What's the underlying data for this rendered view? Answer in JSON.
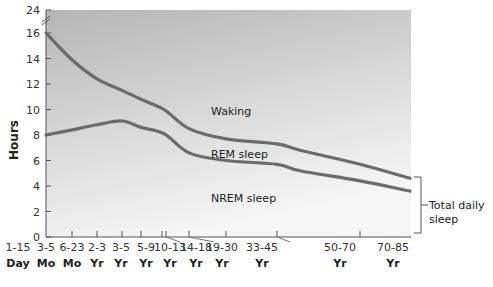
{
  "chart_data": {
    "type": "line",
    "title": "",
    "xlabel": "",
    "ylabel": "Hours",
    "ylim": [
      0,
      24
    ],
    "y_axis_break": true,
    "yticks": [
      0,
      2,
      4,
      6,
      8,
      10,
      12,
      14,
      16,
      24
    ],
    "grid": false,
    "categories": [
      {
        "range": "1-15",
        "unit": "Day"
      },
      {
        "range": "3-5",
        "unit": "Mo"
      },
      {
        "range": "6-23",
        "unit": "Mo"
      },
      {
        "range": "2-3",
        "unit": "Yr"
      },
      {
        "range": "3-5",
        "unit": "Yr"
      },
      {
        "range": "5-9",
        "unit": "Yr"
      },
      {
        "range": "10-13",
        "unit": "Yr"
      },
      {
        "range": "14-18",
        "unit": "Yr"
      },
      {
        "range": "19-30",
        "unit": "Yr"
      },
      {
        "range": "33-45",
        "unit": "Yr"
      },
      {
        "range": "50-70",
        "unit": "Yr"
      },
      {
        "range": "70-85",
        "unit": "Yr"
      }
    ],
    "series": [
      {
        "name": "Total daily sleep (NREM + REM)",
        "values": [
          16.0,
          13.9,
          12.4,
          11.5,
          10.8,
          10.0,
          8.5,
          7.7,
          7.3,
          6.8,
          5.7,
          4.6
        ]
      },
      {
        "name": "NREM sleep",
        "values": [
          8.0,
          8.4,
          8.8,
          9.1,
          8.6,
          8.1,
          6.6,
          6.0,
          5.7,
          5.2,
          4.4,
          3.6
        ]
      }
    ],
    "regions": [
      "Waking",
      "REM sleep",
      "NREM sleep"
    ],
    "annotations": [
      "Total daily sleep"
    ]
  },
  "axis": {
    "ylabel": "Hours",
    "yticks": [
      "0",
      "2",
      "4",
      "6",
      "8",
      "10",
      "12",
      "14",
      "16",
      "24"
    ],
    "xticks": [
      {
        "range": "1-15",
        "unit": "Day"
      },
      {
        "range": "3-5",
        "unit": "Mo"
      },
      {
        "range": "6-23",
        "unit": "Mo"
      },
      {
        "range": "2-3",
        "unit": "Yr"
      },
      {
        "range": "3-5",
        "unit": "Yr"
      },
      {
        "range": "5-9",
        "unit": "Yr"
      },
      {
        "range": "10-13",
        "unit": "Yr"
      },
      {
        "range": "14-18",
        "unit": "Yr"
      },
      {
        "range": "19-30",
        "unit": "Yr"
      },
      {
        "range": "33-45",
        "unit": "Yr"
      },
      {
        "range": "50-70",
        "unit": "Yr"
      },
      {
        "range": "70-85",
        "unit": "Yr"
      }
    ]
  },
  "labels": {
    "waking": "Waking",
    "rem": "REM sleep",
    "nrem": "NREM sleep",
    "bracket_line1": "Total daily",
    "bracket_line2": "sleep"
  },
  "colors": {
    "curve": "#6b6b6b",
    "plot_top": "#b8b8b8",
    "plot_bottom": "#f4f4f4"
  }
}
